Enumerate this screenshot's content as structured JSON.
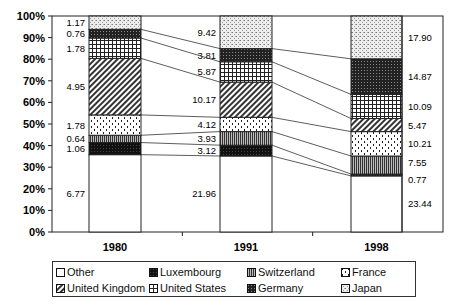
{
  "chart_data": {
    "type": "bar",
    "stacked": true,
    "percent_stacked": true,
    "title": "",
    "xlabel": "",
    "ylabel": "",
    "ylim": [
      0,
      100
    ],
    "yticks": [
      "0%",
      "10%",
      "20%",
      "30%",
      "40%",
      "50%",
      "60%",
      "70%",
      "80%",
      "90%",
      "100%"
    ],
    "categories": [
      "1980",
      "1991",
      "1998"
    ],
    "grid": false,
    "legend_position": "bottom",
    "series": [
      {
        "name": "Other",
        "values": [
          6.77,
          21.96,
          23.44
        ],
        "pattern": "white"
      },
      {
        "name": "Luxembourg",
        "values": [
          1.06,
          3.12,
          0.77
        ],
        "pattern": "solid-black"
      },
      {
        "name": "Switzerland",
        "values": [
          0.64,
          3.93,
          7.55
        ],
        "pattern": "vertical-stripes"
      },
      {
        "name": "France",
        "values": [
          1.78,
          4.12,
          10.21
        ],
        "pattern": "dotted-dashes"
      },
      {
        "name": "United Kingdom",
        "values": [
          4.95,
          10.17,
          5.47
        ],
        "pattern": "diagonal-hatch"
      },
      {
        "name": "United States",
        "values": [
          1.78,
          5.87,
          10.09
        ],
        "pattern": "grid"
      },
      {
        "name": "Germany",
        "values": [
          0.76,
          3.81,
          14.87
        ],
        "pattern": "dense-dark-dots"
      },
      {
        "name": "Japan",
        "values": [
          1.17,
          9.42,
          17.9
        ],
        "pattern": "light-speckle"
      }
    ],
    "value_labels": {
      "1980": [
        "6.77",
        "1.06",
        "0.64",
        "1.78",
        "4.95",
        "1.78",
        "0.76",
        "1.17"
      ],
      "1991": [
        "21.96",
        "3.12",
        "3.93",
        "4.12",
        "10.17",
        "5.87",
        "3.81",
        "9.42"
      ],
      "1998": [
        "23.44",
        "0.77",
        "7.55",
        "10.21",
        "5.47",
        "10.09",
        "14.87",
        "17.90"
      ]
    },
    "annotations": "Connector lines join matching segment boundaries between adjacent bars"
  },
  "legend": {
    "items": [
      {
        "label": "Other"
      },
      {
        "label": "Luxembourg"
      },
      {
        "label": "Switzerland"
      },
      {
        "label": "France"
      },
      {
        "label": "United Kingdom"
      },
      {
        "label": "United States"
      },
      {
        "label": "Germany"
      },
      {
        "label": "Japan"
      }
    ]
  }
}
